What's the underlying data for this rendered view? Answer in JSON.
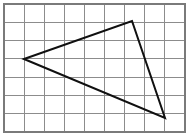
{
  "figure": {
    "type": "geometry-grid-figure",
    "canvas": {
      "width": 190,
      "height": 136,
      "background": "#ffffff"
    },
    "grid": {
      "name": "square-grid",
      "columns": 9,
      "rows": 7,
      "x_start": 4,
      "y_start": 4,
      "x_end": 185,
      "y_end": 132,
      "cell_width": 20.1,
      "cell_height": 18.29,
      "line_color": "#8c8c8c",
      "line_width": 1,
      "border_color": "#7a7a7a",
      "border_width": 1.2
    },
    "shape": {
      "name": "triangle",
      "stroke_color": "#101010",
      "stroke_width": 2,
      "fill": "none",
      "vertices": [
        {
          "label": "left-vertex",
          "x": 24,
          "y": 59,
          "grid_col": 1,
          "grid_row": 3
        },
        {
          "label": "top-vertex",
          "x": 132,
          "y": 21,
          "grid_col": 6.4,
          "grid_row": 0.93
        },
        {
          "label": "bottom-right-vertex",
          "x": 165,
          "y": 118,
          "grid_col": 8,
          "grid_row": 6.23
        }
      ],
      "edges": [
        {
          "label": "left-to-top",
          "from": "left-vertex",
          "to": "top-vertex"
        },
        {
          "label": "top-to-bottom-right",
          "from": "top-vertex",
          "to": "bottom-right-vertex"
        },
        {
          "label": "bottom-right-to-left",
          "from": "bottom-right-vertex",
          "to": "left-vertex"
        }
      ]
    }
  }
}
